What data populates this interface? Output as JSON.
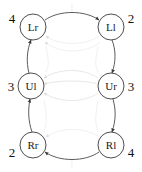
{
  "figure": {
    "type": "directed-graph",
    "width": 142,
    "height": 172,
    "background_color": "#ffffff",
    "edge_dark_color": "#4a4a4a",
    "edge_faint_color": "#e3e3e3",
    "node_stroke_color": "#3a3a3a",
    "node_fill_color": "#ffffff",
    "text_color": "#1a1a1a"
  },
  "nodes": [
    {
      "id": "Lr",
      "label": "Lr",
      "side_label": "4",
      "x": 33,
      "y": 27,
      "r": 13,
      "label_x": 12,
      "label_y": 18
    },
    {
      "id": "Ll",
      "label": "Ll",
      "side_label": "2",
      "x": 111,
      "y": 27,
      "r": 13,
      "label_x": 131,
      "label_y": 18
    },
    {
      "id": "Ul",
      "label": "Ul",
      "side_label": "3",
      "x": 31,
      "y": 86,
      "r": 13,
      "label_x": 11,
      "label_y": 86
    },
    {
      "id": "Ur",
      "label": "Ur",
      "side_label": "3",
      "x": 111,
      "y": 86,
      "r": 13,
      "label_x": 131,
      "label_y": 86
    },
    {
      "id": "Rr",
      "label": "Rr",
      "side_label": "2",
      "x": 33,
      "y": 145,
      "r": 13,
      "label_x": 12,
      "label_y": 152
    },
    {
      "id": "Rl",
      "label": "Rl",
      "side_label": "4",
      "x": 111,
      "y": 145,
      "r": 13,
      "label_x": 131,
      "label_y": 152
    }
  ],
  "edges": [
    {
      "from": "Lr",
      "to": "Ll",
      "style": "dark",
      "direction": "right"
    },
    {
      "from": "Rl",
      "to": "Rr",
      "style": "dark",
      "direction": "left"
    },
    {
      "from": "Ul",
      "to": "Lr",
      "style": "dark",
      "direction": "up"
    },
    {
      "from": "Rr",
      "to": "Ul",
      "style": "dark",
      "direction": "up"
    },
    {
      "from": "Ll",
      "to": "Ur",
      "style": "dark",
      "direction": "down"
    },
    {
      "from": "Ur",
      "to": "Rl",
      "style": "dark",
      "direction": "down"
    },
    {
      "from": "Ll",
      "to": "Lr",
      "style": "faint",
      "direction": "left"
    },
    {
      "from": "Ll",
      "to": "Lr",
      "style": "faint",
      "direction": "left"
    },
    {
      "from": "Ur",
      "to": "Ul",
      "style": "faint",
      "direction": "left"
    },
    {
      "from": "Ur",
      "to": "Ul",
      "style": "faint",
      "direction": "left"
    },
    {
      "from": "Ur",
      "to": "Ul",
      "style": "faint",
      "direction": "left"
    },
    {
      "from": "Rl",
      "to": "Rr",
      "style": "faint",
      "direction": "left"
    }
  ]
}
